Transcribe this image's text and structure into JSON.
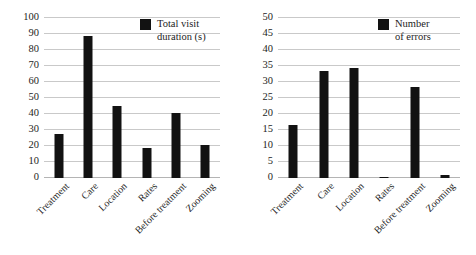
{
  "figure": {
    "background": "#ffffff",
    "bar_color": "#121212",
    "grid_color": "#c9c9c9"
  },
  "chart_data": [
    {
      "type": "bar",
      "title": "",
      "xlabel": "",
      "ylabel": "",
      "categories": [
        "Treatment",
        "Care",
        "Location",
        "Rates",
        "Before treatment",
        "Zooming"
      ],
      "values": [
        27.5,
        89,
        45,
        19,
        40.5,
        20.5
      ],
      "series": [
        {
          "name": "Total visit duration (s)",
          "values": [
            27.5,
            89,
            45,
            19,
            40.5,
            20.5
          ]
        }
      ],
      "legend": {
        "position": "top-right",
        "entries": [
          "Total visit duration (s)"
        ],
        "line1": "Total visit",
        "line2": "duration (s)"
      },
      "ylim": [
        0,
        100
      ],
      "ytick_step": 10,
      "yticks": [
        "0",
        "10",
        "20",
        "30",
        "40",
        "50",
        "60",
        "70",
        "80",
        "90",
        "100"
      ],
      "grid": true
    },
    {
      "type": "bar",
      "title": "",
      "xlabel": "",
      "ylabel": "",
      "categories": [
        "Treatment",
        "Care",
        "Location",
        "Rates",
        "Before treatment",
        "Zooming"
      ],
      "values": [
        16.5,
        33.5,
        34.5,
        0.4,
        28.3,
        1.0
      ],
      "series": [
        {
          "name": "Number of errors",
          "values": [
            16.5,
            33.5,
            34.5,
            0.4,
            28.3,
            1.0
          ]
        }
      ],
      "legend": {
        "position": "top-right",
        "entries": [
          "Number of errors"
        ],
        "line1": "Number",
        "line2": "of errors"
      },
      "ylim": [
        0,
        50
      ],
      "ytick_step": 5,
      "yticks": [
        "0",
        "5",
        "10",
        "15",
        "20",
        "25",
        "30",
        "35",
        "40",
        "45",
        "50"
      ],
      "grid": true
    }
  ]
}
